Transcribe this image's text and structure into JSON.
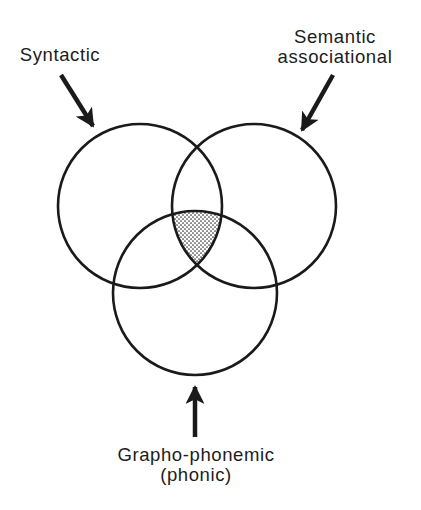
{
  "diagram": {
    "type": "venn",
    "labels": {
      "syntactic": "Syntactic",
      "semantic_line1": "Semantic",
      "semantic_line2": "associational",
      "grapho_line1": "Grapho-phonemic",
      "grapho_line2": "(phonic)"
    },
    "circles": [
      {
        "name": "Syntactic",
        "cx": 140,
        "cy": 206,
        "r": 82
      },
      {
        "name": "Semantic associational",
        "cx": 254,
        "cy": 206,
        "r": 82
      },
      {
        "name": "Grapho-phonemic (phonic)",
        "cx": 195,
        "cy": 293,
        "r": 82
      }
    ],
    "highlight": {
      "region": "intersection of all three circles",
      "fill": "dotted stipple"
    },
    "arrows": [
      {
        "target": "Syntactic",
        "from": [
          61,
          75
        ],
        "to": [
          95,
          129
        ]
      },
      {
        "target": "Semantic associational",
        "from": [
          333,
          75
        ],
        "to": [
          300,
          133
        ]
      },
      {
        "target": "Grapho-phonemic (phonic)",
        "from": [
          195,
          437
        ],
        "to": [
          195,
          384
        ]
      }
    ],
    "colors": {
      "stroke": "#1a1a1a",
      "background": "#ffffff",
      "stipple_dot": "#333333"
    }
  }
}
